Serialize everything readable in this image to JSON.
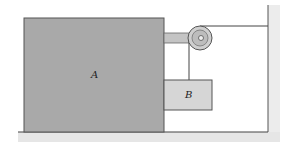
{
  "diagram": {
    "type": "mechanics-pulley-system",
    "labels": {
      "block_a": "A",
      "block_b": "B"
    },
    "colors": {
      "block_fill": "#a9a9a9",
      "block_b_fill": "#d6d6d6",
      "arm_fill": "#c4c4c4",
      "pulley_fill": "#cfcfcf",
      "line": "#444444",
      "ground_shade": "#e6e6e6"
    }
  }
}
